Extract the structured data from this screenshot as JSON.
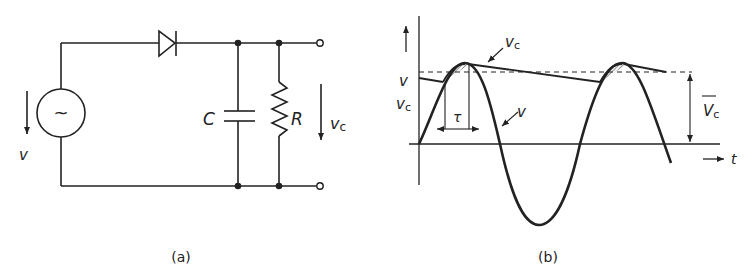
{
  "figure": {
    "panel_a": {
      "caption": "(a)",
      "source_symbol": "~",
      "source_label": "v",
      "capacitor_label": "C",
      "resistor_label": "R",
      "output_label": "v",
      "output_sub": "c"
    },
    "panel_b": {
      "caption": "(b)",
      "y_axis_label_1": "v",
      "y_axis_label_2": "v",
      "y_axis_label_2_sub": "c",
      "vc_curve_label": "v",
      "vc_curve_sub": "c",
      "v_curve_label": "v",
      "tau_label": "τ",
      "avg_label": "V",
      "avg_sub": "c",
      "t_axis_label": "t"
    }
  },
  "colors": {
    "ink": "#222222",
    "background": "#ffffff"
  }
}
